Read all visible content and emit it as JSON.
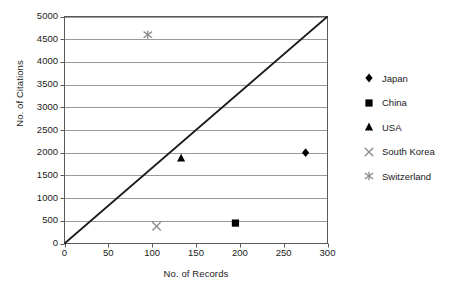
{
  "chart_data": {
    "type": "scatter",
    "title": "",
    "xlabel": "No. of Records",
    "ylabel": "No. of Citations",
    "xlim": [
      0,
      300
    ],
    "ylim": [
      0,
      5000
    ],
    "xticks": [
      0,
      50,
      100,
      150,
      200,
      250,
      300
    ],
    "yticks": [
      0,
      500,
      1000,
      1500,
      2000,
      2500,
      3000,
      3500,
      4000,
      4500,
      5000
    ],
    "grid": "horizontal",
    "legend_position": "right",
    "reference_line": {
      "name": "diagonal-reference-line",
      "from": [
        0,
        0
      ],
      "to": [
        300,
        5000
      ],
      "color": "#1a1a1a"
    },
    "series": [
      {
        "name": "Japan",
        "marker": "diamond",
        "color": "#000000",
        "points": [
          {
            "x": 275,
            "y": 2000
          }
        ]
      },
      {
        "name": "China",
        "marker": "square",
        "color": "#000000",
        "points": [
          {
            "x": 195,
            "y": 450
          }
        ]
      },
      {
        "name": "USA",
        "marker": "triangle",
        "color": "#000000",
        "points": [
          {
            "x": 133,
            "y": 1880
          }
        ]
      },
      {
        "name": "South Korea",
        "marker": "x-cross",
        "color": "#8c8c8c",
        "points": [
          {
            "x": 105,
            "y": 380
          }
        ]
      },
      {
        "name": "Switzerland",
        "marker": "asterisk",
        "color": "#8c8c8c",
        "points": [
          {
            "x": 95,
            "y": 4600
          }
        ]
      }
    ]
  },
  "axes": {
    "x_title": "No. of Records",
    "y_title": "No. of Citations",
    "x_tick_labels": [
      "0",
      "50",
      "100",
      "150",
      "200",
      "250",
      "300"
    ],
    "y_tick_labels": [
      "0",
      "500",
      "1000",
      "1500",
      "2000",
      "2500",
      "3000",
      "3500",
      "4000",
      "4500",
      "5000"
    ]
  },
  "legend": {
    "items": [
      {
        "label": "Japan",
        "marker": "diamond-marker-icon"
      },
      {
        "label": "China",
        "marker": "square-marker-icon"
      },
      {
        "label": "USA",
        "marker": "triangle-marker-icon"
      },
      {
        "label": "South Korea",
        "marker": "x-cross-marker-icon"
      },
      {
        "label": "Switzerland",
        "marker": "asterisk-marker-icon"
      }
    ]
  },
  "colors": {
    "plot_border": "#5a5a5a",
    "gridline": "#9a9a9a",
    "marker_dark": "#000000",
    "marker_gray": "#8c8c8c",
    "text": "#1a1a1a",
    "background": "#ffffff"
  }
}
